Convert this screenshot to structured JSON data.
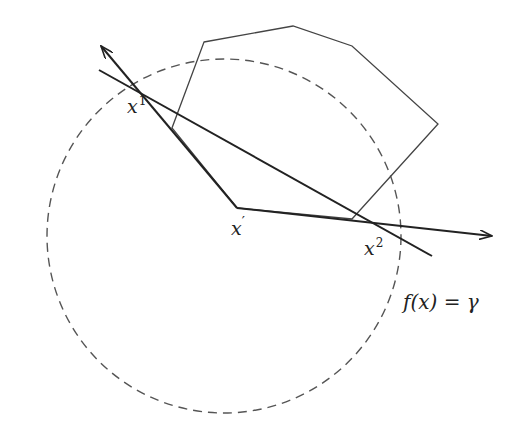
{
  "diagram": {
    "level_set": {
      "label": "f(x) = γ",
      "style": "dashed",
      "color": "#555555",
      "center": [
        224,
        236
      ],
      "radius": 177
    },
    "polygon": {
      "color": "#444444",
      "vertices": [
        [
          204,
          42
        ],
        [
          293,
          26
        ],
        [
          352,
          46
        ],
        [
          438,
          124
        ],
        [
          352,
          219
        ],
        [
          237,
          208
        ],
        [
          172,
          128
        ]
      ]
    },
    "points": {
      "x1": {
        "base": "x",
        "sup": "1",
        "pos": [
          133,
          88
        ]
      },
      "xprime": {
        "base": "x",
        "sup": "′",
        "pos": [
          237,
          208
        ]
      },
      "x2": {
        "base": "x",
        "sup": "2",
        "pos": [
          372,
          223
        ]
      }
    },
    "segments": [
      {
        "name": "arrow-from-xprime-to-x1",
        "from": [
          237,
          208
        ],
        "to": [
          101,
          46
        ],
        "arrow": true
      },
      {
        "name": "arrow-from-xprime-to-x2",
        "from": [
          237,
          208
        ],
        "to": [
          492,
          236
        ],
        "arrow": true
      },
      {
        "name": "line-through-x1-x2",
        "from": [
          99,
          70
        ],
        "to": [
          432,
          256
        ],
        "arrow": false
      }
    ],
    "line_color": "#222222"
  }
}
